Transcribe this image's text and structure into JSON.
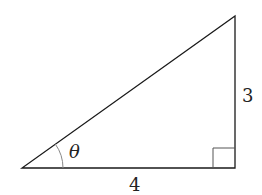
{
  "diagram": {
    "type": "right-triangle",
    "vertices": {
      "angle_vertex": [
        22,
        168
      ],
      "right_angle_vertex": [
        235,
        168
      ],
      "top_vertex": [
        235,
        16
      ]
    },
    "labels": {
      "opposite_side": "3",
      "adjacent_side": "4",
      "angle": "θ"
    },
    "colors": {
      "stroke": "#1a1a1a",
      "arc": "#888888",
      "right_angle_marker": "#555555"
    }
  }
}
